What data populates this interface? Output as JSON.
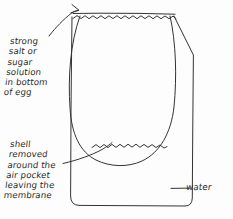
{
  "diagram": {
    "style": "hand-drawn pencil sketch, black ink on white paper",
    "ink_color": "#333333",
    "paper_color": "#fdfdfd",
    "labels": {
      "solution": "strong\nsalt or\nsugar\nsolution\nin bottom\nof egg",
      "shell": "shell\nremoved\naround the\nair pocket\nleaving the\nmembrane",
      "water": "water"
    },
    "parts": [
      {
        "name": "jar",
        "description": "outer container with vertical walls and rounded bottom corners"
      },
      {
        "name": "water-surface",
        "description": "wavy line across the top of the jar"
      },
      {
        "name": "egg",
        "description": "large oval egg suspended inside the jar"
      },
      {
        "name": "solution-surface",
        "description": "wavy line near the bottom inside the egg"
      },
      {
        "name": "arrow-to-water-surface",
        "description": "curved arrow pointing up at the water surface"
      },
      {
        "name": "leader-to-egg-bottom",
        "description": "line from shell text to the egg bottom membrane"
      },
      {
        "name": "leader-to-jar-wall",
        "description": "line from water text to the jar wall"
      }
    ]
  }
}
